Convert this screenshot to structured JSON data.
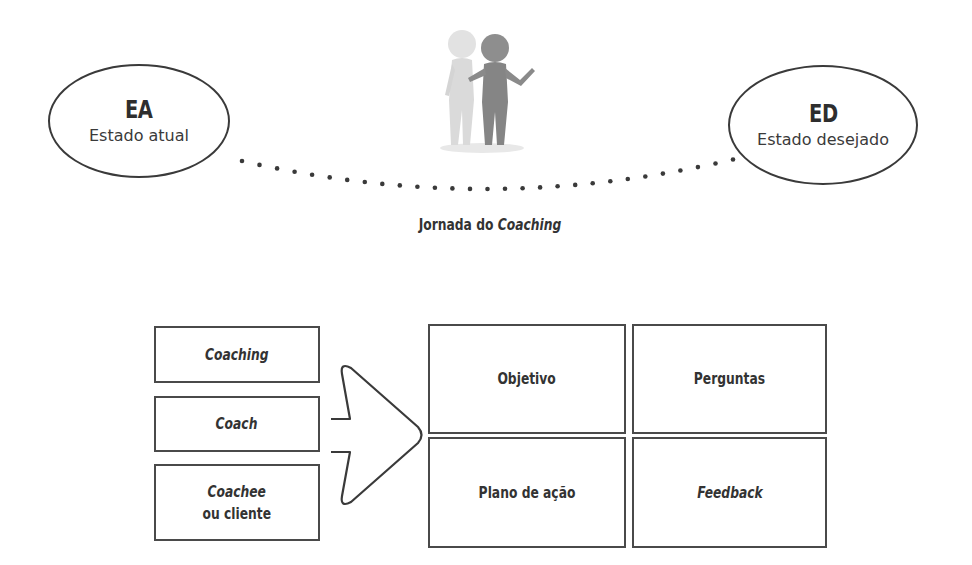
{
  "journey": {
    "start": {
      "code": "EA",
      "label": "Estado atual"
    },
    "end": {
      "code": "ED",
      "label": "Estado desejado"
    },
    "figure_icon": "two-people-coaching-figure",
    "caption_plain": "Jornada do ",
    "caption_italic": "Coaching"
  },
  "inputs": [
    {
      "line1": "Coaching",
      "line1_italic": true
    },
    {
      "line1": "Coach",
      "line1_italic": true
    },
    {
      "line1": "Coachee",
      "line1_italic": true,
      "line2": "ou cliente",
      "line2_italic": false
    }
  ],
  "arrow_icon": "right-arrow-outline",
  "grid": [
    {
      "label": "Objetivo",
      "italic": false
    },
    {
      "label": "Perguntas",
      "italic": false
    },
    {
      "label": "Plano de ação",
      "italic": false
    },
    {
      "label": "Feedback",
      "italic": true
    }
  ],
  "colors": {
    "stroke": "#3a3a3a",
    "text": "#333333",
    "background": "#ffffff"
  }
}
